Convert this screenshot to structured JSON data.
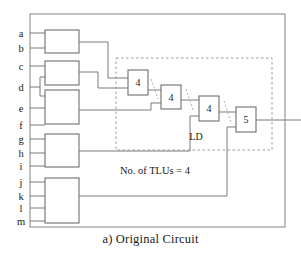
{
  "figure": {
    "caption": "a) Original Circuit",
    "annotation_tlu_count": "No. of TLUs = 4",
    "partition_label": "LD"
  },
  "inputs": [
    {
      "label": "a",
      "y": 33
    },
    {
      "label": "b",
      "y": 48
    },
    {
      "label": "c",
      "y": 66
    },
    {
      "label": "d",
      "y": 87
    },
    {
      "label": "e",
      "y": 108
    },
    {
      "label": "f",
      "y": 125
    },
    {
      "label": "g",
      "y": 139
    },
    {
      "label": "h",
      "y": 153
    },
    {
      "label": "i",
      "y": 166
    },
    {
      "label": "j",
      "y": 182
    },
    {
      "label": "k",
      "y": 196
    },
    {
      "label": "l",
      "y": 208
    },
    {
      "label": "m",
      "y": 221
    }
  ],
  "logic_blocks": [
    {
      "name": "block-1",
      "x": 45,
      "y": 30,
      "w": 34,
      "h": 23,
      "inputs": [
        "a",
        "b"
      ]
    },
    {
      "name": "block-2",
      "x": 45,
      "y": 61,
      "w": 34,
      "h": 24,
      "inputs": [
        "c",
        "d"
      ]
    },
    {
      "name": "block-3",
      "x": 45,
      "y": 90,
      "w": 34,
      "h": 34,
      "inputs": [
        "d",
        "e",
        "f"
      ]
    },
    {
      "name": "block-4",
      "x": 45,
      "y": 134,
      "w": 34,
      "h": 33,
      "inputs": [
        "g",
        "h",
        "i"
      ]
    },
    {
      "name": "block-5",
      "x": 45,
      "y": 178,
      "w": 34,
      "h": 45,
      "inputs": [
        "j",
        "k",
        "l",
        "m"
      ]
    }
  ],
  "tlus": [
    {
      "name": "tlu-1",
      "label": "4",
      "x": 128,
      "y": 70,
      "w": 20,
      "h": 25
    },
    {
      "name": "tlu-2",
      "label": "4",
      "x": 161,
      "y": 85,
      "w": 20,
      "h": 24
    },
    {
      "name": "tlu-3",
      "label": "4",
      "x": 199,
      "y": 96,
      "w": 20,
      "h": 25
    },
    {
      "name": "tlu-4",
      "label": "5",
      "x": 236,
      "y": 107,
      "w": 20,
      "h": 25
    }
  ],
  "partition": {
    "x": 116,
    "y": 58,
    "w": 156,
    "h": 92,
    "style": "dashed"
  },
  "frame": {
    "x": 30,
    "y": 14,
    "w": 255,
    "h": 213
  },
  "colors": {
    "line": "#7a7a7a",
    "box_border": "#6e6e6e",
    "dashed": "#9a9a9a",
    "text": "#1a1a1a",
    "background": "#ffffff"
  }
}
